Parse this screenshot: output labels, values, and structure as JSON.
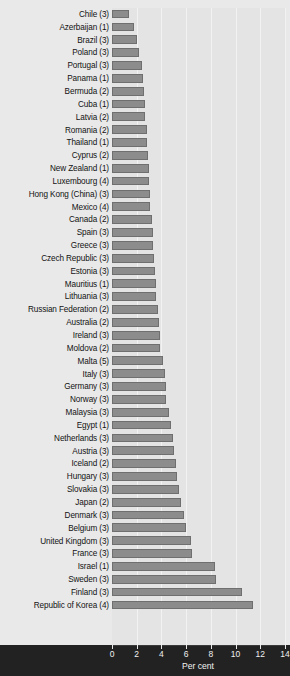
{
  "chart_data": {
    "type": "bar",
    "orientation": "horizontal",
    "title": "",
    "xlabel": "Per cent",
    "ylabel": "",
    "xlim": [
      0,
      14
    ],
    "xticks": [
      0,
      2,
      4,
      6,
      8,
      10,
      12,
      14
    ],
    "xtick_labels": [
      "0",
      "2",
      "4",
      "6",
      "8",
      "10",
      "12",
      "14"
    ],
    "grid": true,
    "legend": "none",
    "bar_color": "#8c8c8c",
    "bar_edge_color": "#6f6f6f",
    "plot_background": "#e4e4e4",
    "axis_band_color": "#222222",
    "categories": [
      "Chile (3)",
      "Azerbaijan (1)",
      "Brazil (3)",
      "Poland (3)",
      "Portugal (3)",
      "Panama (1)",
      "Bermuda (2)",
      "Cuba (1)",
      "Latvia (2)",
      "Romania (2)",
      "Thailand (1)",
      "Cyprus (2)",
      "New Zealand (1)",
      "Luxembourg (4)",
      "Hong Kong (China) (3)",
      "Mexico (4)",
      "Canada (2)",
      "Spain (3)",
      "Greece (3)",
      "Czech Republic (3)",
      "Estonia (3)",
      "Mauritius (1)",
      "Lithuania (3)",
      "Russian Federation (2)",
      "Australia (2)",
      "Ireland (3)",
      "Moldova (2)",
      "Malta (5)",
      "Italy (3)",
      "Germany (3)",
      "Norway (3)",
      "Malaysia (3)",
      "Egypt (1)",
      "Netherlands (3)",
      "Austria (3)",
      "Iceland (2)",
      "Hungary (3)",
      "Slovakia (3)",
      "Japan (2)",
      "Denmark (3)",
      "Belgium (3)",
      "United Kingdom (3)",
      "France (3)",
      "Israel (1)",
      "Sweden (3)",
      "Finland (3)",
      "Republic of Korea (4)"
    ],
    "values": [
      1.4,
      1.8,
      2.0,
      2.2,
      2.4,
      2.5,
      2.6,
      2.7,
      2.7,
      2.8,
      2.8,
      2.9,
      3.0,
      3.0,
      3.1,
      3.1,
      3.2,
      3.3,
      3.3,
      3.4,
      3.5,
      3.6,
      3.6,
      3.7,
      3.8,
      3.9,
      3.9,
      4.1,
      4.3,
      4.4,
      4.4,
      4.6,
      4.8,
      4.9,
      5.0,
      5.2,
      5.3,
      5.4,
      5.6,
      5.8,
      6.0,
      6.4,
      6.5,
      8.3,
      8.4,
      10.5,
      11.4
    ]
  }
}
